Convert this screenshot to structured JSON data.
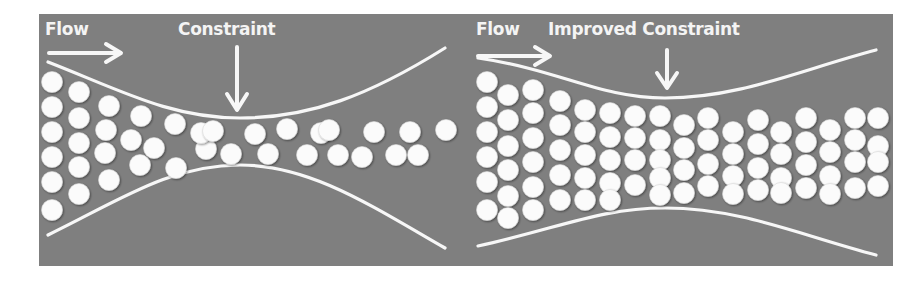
{
  "figure": {
    "background_color": "#7f7f7f",
    "foreground_color": "#f7f7f7"
  },
  "panels": [
    {
      "id": "original",
      "flow_label": "Flow",
      "constraint_label": "Constraint",
      "flow_arrow": {
        "x1": 49,
        "y1": 53,
        "x2": 120,
        "y2": 53
      },
      "constraint_arrow": {
        "x": 237,
        "y1": 47,
        "y2": 110
      },
      "flow_label_pos": {
        "x": 45,
        "y": 35
      },
      "constraint_label_pos": {
        "x": 178,
        "y": 35
      },
      "top_curve": "M 48 62 C 120 90, 170 118, 240 118 C 310 118, 370 95, 445 48",
      "bottom_curve": "M 48 235 C 120 200, 170 165, 240 165 C 310 165, 370 205, 445 248",
      "ball_radius": 10.5,
      "balls": [
        [
          52,
          82
        ],
        [
          52,
          107
        ],
        [
          52,
          132
        ],
        [
          52,
          157
        ],
        [
          52,
          182
        ],
        [
          52,
          210
        ],
        [
          79,
          92
        ],
        [
          79,
          118
        ],
        [
          79,
          143
        ],
        [
          79,
          167
        ],
        [
          79,
          194
        ],
        [
          109,
          106
        ],
        [
          106,
          130
        ],
        [
          105,
          153
        ],
        [
          109,
          180
        ],
        [
          141,
          116
        ],
        [
          131,
          140
        ],
        [
          140,
          165
        ],
        [
          154,
          148
        ],
        [
          175,
          124
        ],
        [
          176,
          168
        ],
        [
          206,
          149
        ],
        [
          201,
          133
        ],
        [
          213,
          131
        ],
        [
          231,
          154
        ],
        [
          255,
          134
        ],
        [
          268,
          154
        ],
        [
          287,
          129
        ],
        [
          307,
          155
        ],
        [
          321,
          133
        ],
        [
          338,
          155
        ],
        [
          329,
          130
        ],
        [
          362,
          157
        ],
        [
          374,
          132
        ],
        [
          396,
          155
        ],
        [
          410,
          132
        ],
        [
          418,
          155
        ],
        [
          446,
          130
        ]
      ]
    },
    {
      "id": "improved",
      "flow_label": "Flow",
      "constraint_label": "Improved Constraint",
      "flow_arrow": {
        "x1": 478,
        "y1": 57,
        "x2": 549,
        "y2": 57
      },
      "constraint_arrow": {
        "x": 667,
        "y1": 50,
        "y2": 88
      },
      "flow_label_pos": {
        "x": 476,
        "y": 35
      },
      "constraint_label_pos": {
        "x": 548,
        "y": 35
      },
      "top_curve": "M 478 58 C 560 70, 600 98, 665 98 C 740 98, 800 70, 876 50",
      "bottom_curve": "M 478 246 C 560 228, 600 208, 665 208 C 740 208, 800 235, 876 255",
      "ball_radius": 10.5,
      "balls": []
    }
  ],
  "chart_data": {
    "type": "diagram",
    "title": "",
    "panels": [
      {
        "name": "Constraint",
        "flow_label": "Flow",
        "channel_narrowest_gap_px": 47,
        "balls_visible": 38
      },
      {
        "name": "Improved Constraint",
        "flow_label": "Flow",
        "channel_narrowest_gap_px": 110,
        "balls_visible": 90
      }
    ]
  }
}
